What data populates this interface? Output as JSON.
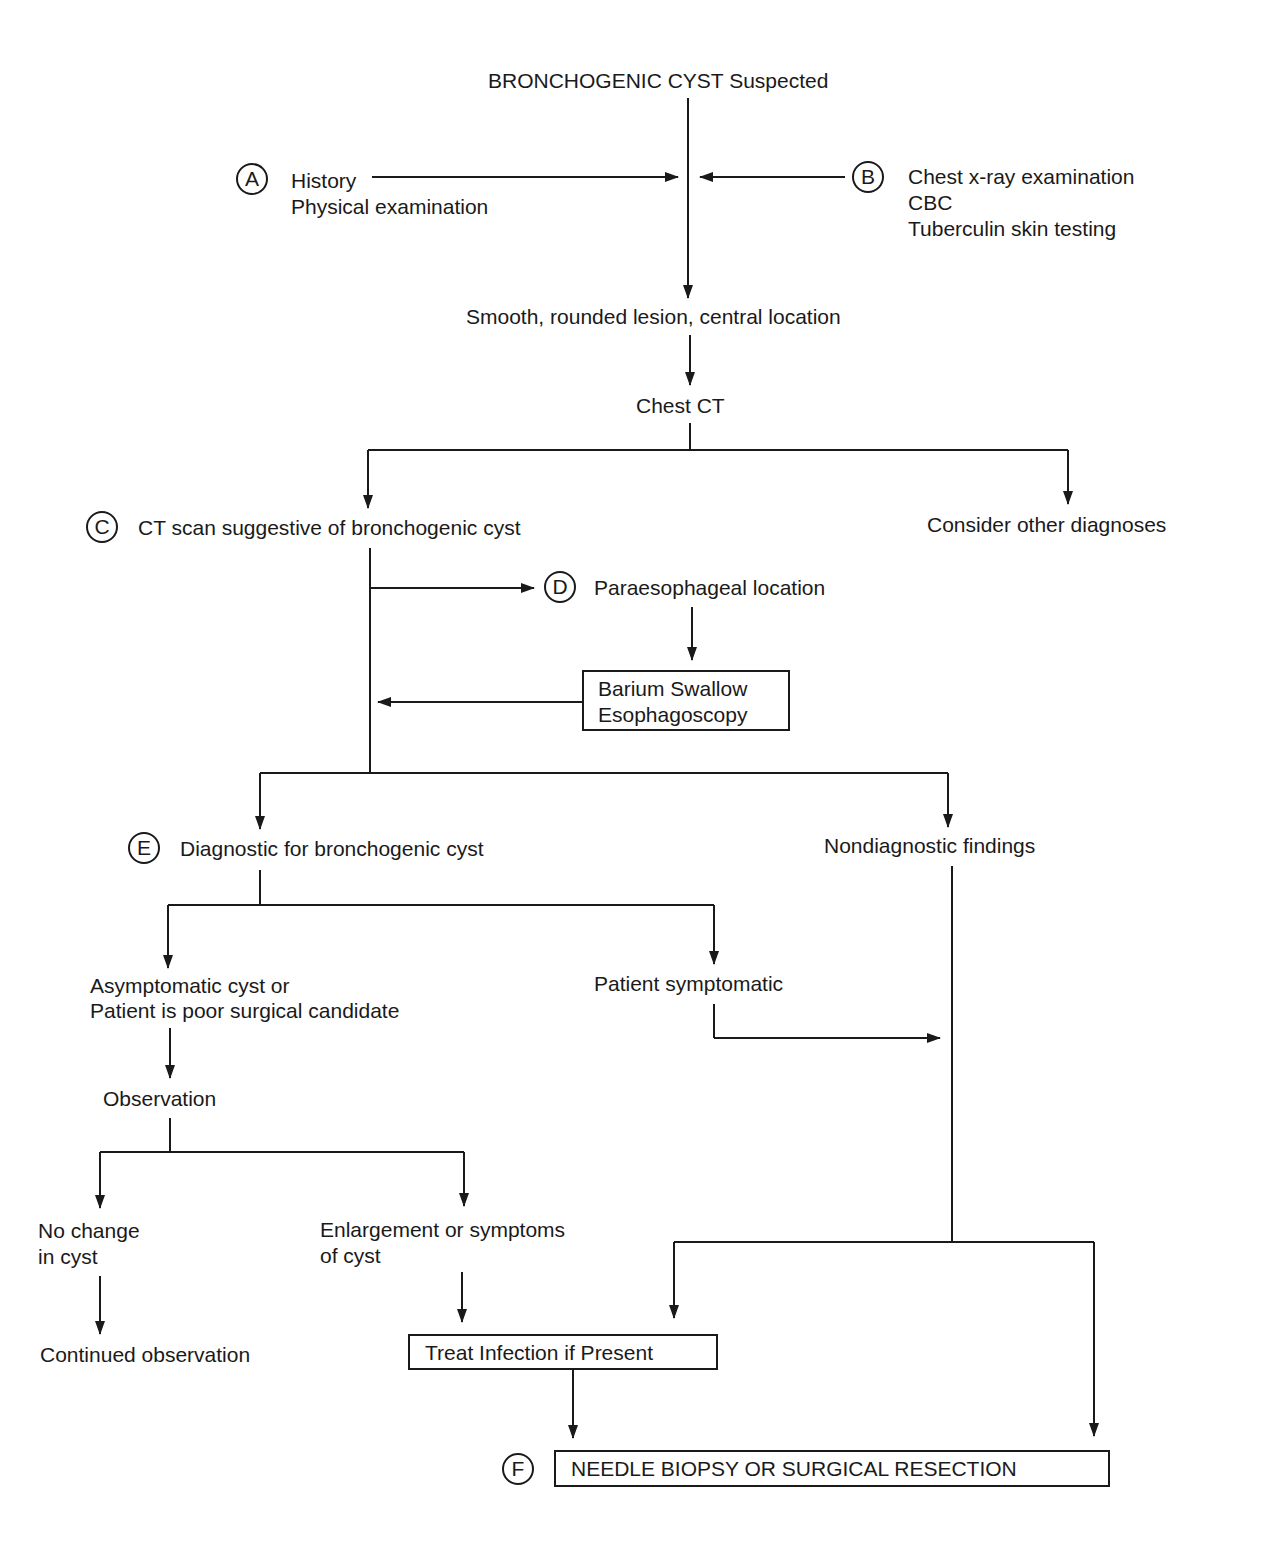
{
  "nodes": {
    "start": "BRONCHOGENIC CYST Suspected",
    "a_line1": "History",
    "a_line2": "Physical examination",
    "b_line1": "Chest x-ray examination",
    "b_line2": "CBC",
    "b_line3": "Tuberculin skin testing",
    "smooth": "Smooth, rounded lesion, central location",
    "chest_ct": "Chest CT",
    "c": "CT scan suggestive of bronchogenic cyst",
    "other": "Consider other diagnoses",
    "d": "Paraesophageal location",
    "barium_line1": "Barium Swallow",
    "barium_line2": "Esophagoscopy",
    "e": "Diagnostic for bronchogenic cyst",
    "nondiag": "Nondiagnostic findings",
    "asym_line1": "Asymptomatic cyst or",
    "asym_line2": "Patient is poor surgical candidate",
    "symptomatic": "Patient symptomatic",
    "observation": "Observation",
    "nochange_line1": "No change",
    "nochange_line2": "in cyst",
    "enlarge_line1": "Enlargement or symptoms",
    "enlarge_line2": "of cyst",
    "continued": "Continued observation",
    "treat": "Treat Infection if Present",
    "final": "NEEDLE BIOPSY OR SURGICAL RESECTION"
  },
  "badges": {
    "a": "A",
    "b": "B",
    "c": "C",
    "d": "D",
    "e": "E",
    "f": "F"
  }
}
